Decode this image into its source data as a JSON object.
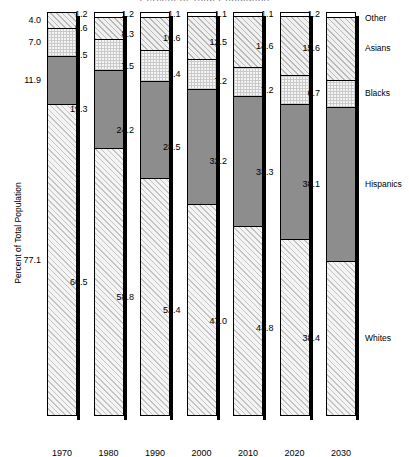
{
  "title": "Percent of Total Population",
  "axes": {
    "ylabel": "Percent of Total Population"
  },
  "legend": [
    {
      "key": "other",
      "label": "Other"
    },
    {
      "key": "asians",
      "label": "Asians"
    },
    {
      "key": "blacks",
      "label": "Blacks"
    },
    {
      "key": "hispanics",
      "label": "Hispanics"
    },
    {
      "key": "whites",
      "label": "Whites"
    }
  ],
  "chart_data": {
    "type": "bar",
    "stacked": true,
    "title": "Percent of Total Population",
    "xlabel": "",
    "ylabel": "Percent of Total Population",
    "ylim": [
      0,
      100
    ],
    "grid": false,
    "legend_position": "right",
    "categories": [
      "1970",
      "1980",
      "1990",
      "2000",
      "2010",
      "2020",
      "2030"
    ],
    "stack_order_bottom_to_top": [
      "Whites",
      "Hispanics",
      "Blacks",
      "Asians",
      "Other"
    ],
    "series": [
      {
        "name": "Whites",
        "values": [
          77.1,
          66.5,
          58.8,
          52.4,
          47.0,
          43.8,
          38.4
        ]
      },
      {
        "name": "Hispanics",
        "values": [
          11.9,
          19.3,
          24.2,
          28.5,
          32.2,
          33.3,
          38.1
        ]
      },
      {
        "name": "Blacks",
        "values": [
          7.0,
          7.5,
          7.5,
          7.4,
          7.2,
          7.2,
          6.7
        ]
      },
      {
        "name": "Asians",
        "values": [
          null,
          5.6,
          8.3,
          10.6,
          12.5,
          14.6,
          15.6
        ]
      },
      {
        "name": "Other",
        "values": [
          4.0,
          1.2,
          1.2,
          1.1,
          1.1,
          1.1,
          1.2
        ]
      }
    ]
  },
  "bars": [
    {
      "year": "1970",
      "segments": [
        {
          "key": "whites",
          "label": "77.1",
          "value": 77.1
        },
        {
          "key": "hispanics",
          "label": "11.9",
          "value": 11.9
        },
        {
          "key": "blacks",
          "label": "7.0",
          "value": 7.0
        },
        {
          "key": "asians",
          "label": "4.0",
          "value": 4.0
        }
      ]
    },
    {
      "year": "1980",
      "segments": [
        {
          "key": "whites",
          "label": "66.5",
          "value": 66.5
        },
        {
          "key": "hispanics",
          "label": "19.3",
          "value": 19.3
        },
        {
          "key": "blacks",
          "label": "7.5",
          "value": 7.5
        },
        {
          "key": "asians",
          "label": "5.6",
          "value": 5.6
        },
        {
          "key": "other",
          "label": "1.2",
          "value": 1.2
        }
      ]
    },
    {
      "year": "1990",
      "segments": [
        {
          "key": "whites",
          "label": "58.8",
          "value": 58.8
        },
        {
          "key": "hispanics",
          "label": "24.2",
          "value": 24.2
        },
        {
          "key": "blacks",
          "label": "7.5",
          "value": 7.5
        },
        {
          "key": "asians",
          "label": "8.3",
          "value": 8.3
        },
        {
          "key": "other",
          "label": "1.2",
          "value": 1.2
        }
      ]
    },
    {
      "year": "2000",
      "segments": [
        {
          "key": "whites",
          "label": "52.4",
          "value": 52.4
        },
        {
          "key": "hispanics",
          "label": "28.5",
          "value": 28.5
        },
        {
          "key": "blacks",
          "label": "7.4",
          "value": 7.4
        },
        {
          "key": "asians",
          "label": "10.6",
          "value": 10.6
        },
        {
          "key": "other",
          "label": "1.1",
          "value": 1.1
        }
      ]
    },
    {
      "year": "2010",
      "segments": [
        {
          "key": "whites",
          "label": "47.0",
          "value": 47.0
        },
        {
          "key": "hispanics",
          "label": "32.2",
          "value": 32.2
        },
        {
          "key": "blacks",
          "label": "7.2",
          "value": 7.2
        },
        {
          "key": "asians",
          "label": "12.5",
          "value": 12.5
        },
        {
          "key": "other",
          "label": "1.1",
          "value": 1.1
        }
      ]
    },
    {
      "year": "2020",
      "segments": [
        {
          "key": "whites",
          "label": "43.8",
          "value": 43.8
        },
        {
          "key": "hispanics",
          "label": "33.3",
          "value": 33.3
        },
        {
          "key": "blacks",
          "label": "7.2",
          "value": 7.2
        },
        {
          "key": "asians",
          "label": "14.6",
          "value": 14.6
        },
        {
          "key": "other",
          "label": "1.1",
          "value": 1.1
        }
      ]
    },
    {
      "year": "2030",
      "segments": [
        {
          "key": "whites",
          "label": "38.4",
          "value": 38.4
        },
        {
          "key": "hispanics",
          "label": "38.1",
          "value": 38.1
        },
        {
          "key": "blacks",
          "label": "6.7",
          "value": 6.7
        },
        {
          "key": "asians",
          "label": "15.6",
          "value": 15.6
        },
        {
          "key": "other",
          "label": "1.2",
          "value": 1.2
        }
      ]
    }
  ],
  "colors": {
    "hispanics_fill": "#8d8d8d",
    "other_fill": "#ffffff",
    "outline": "#000000"
  }
}
